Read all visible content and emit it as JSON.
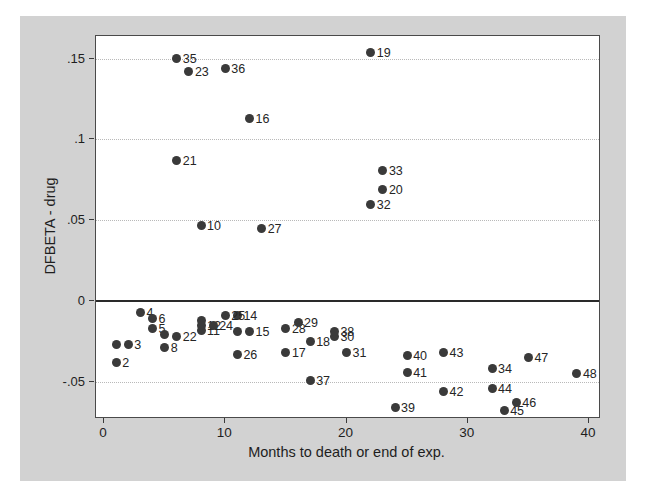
{
  "figure": {
    "page_bg": "#ffffff",
    "panel_bg": "#d2d2d2",
    "plot_bg": "#ffffff",
    "dot_color": "#3a3a3a",
    "grid_color": "#b9b9b9",
    "axis_color": "#2a2a2a"
  },
  "chart_data": {
    "type": "scatter",
    "title": "",
    "xlabel": "Months to death or end of exp.",
    "ylabel": "DFBETA - drug",
    "x_ticks": [
      0,
      10,
      20,
      30,
      40
    ],
    "x_tick_labels": [
      "0",
      "10",
      "20",
      "30",
      "40"
    ],
    "y_ticks": [
      0.15,
      0.1,
      0.05,
      0,
      -0.05
    ],
    "y_tick_labels": [
      ".15",
      ".1",
      ".05",
      "0",
      "-.05"
    ],
    "xlim": [
      -0.66,
      40.95
    ],
    "ylim": [
      -0.0718,
      0.1638
    ],
    "grid": "horizontal-dotted",
    "ref_line_y": 0,
    "legend": "none",
    "marker_labels_position": "right",
    "points": [
      {
        "id": 1,
        "label": "",
        "x": 1,
        "y": -0.027
      },
      {
        "id": 2,
        "label": "2",
        "x": 1,
        "y": -0.038
      },
      {
        "id": 3,
        "label": "3",
        "x": 2,
        "y": -0.027
      },
      {
        "id": 4,
        "label": "4",
        "x": 3,
        "y": -0.007
      },
      {
        "id": 5,
        "label": "5",
        "x": 4,
        "y": -0.017
      },
      {
        "id": 6,
        "label": "6",
        "x": 4,
        "y": -0.011
      },
      {
        "id": 7,
        "label": "",
        "x": 5,
        "y": -0.021
      },
      {
        "id": 8,
        "label": "8",
        "x": 5,
        "y": -0.029
      },
      {
        "id": 9,
        "label": "",
        "x": 8,
        "y": -0.012
      },
      {
        "id": 10,
        "label": "10",
        "x": 8,
        "y": 0.047
      },
      {
        "id": 11,
        "label": "11",
        "x": 8,
        "y": -0.018
      },
      {
        "id": 12,
        "label": "12",
        "x": 8,
        "y": -0.015
      },
      {
        "id": 13,
        "label": "",
        "x": 11,
        "y": -0.019
      },
      {
        "id": 14,
        "label": "14",
        "x": 11,
        "y": -0.009
      },
      {
        "id": 15,
        "label": "15",
        "x": 12,
        "y": -0.019
      },
      {
        "id": 16,
        "label": "16",
        "x": 12,
        "y": 0.113
      },
      {
        "id": 17,
        "label": "17",
        "x": 15,
        "y": -0.032
      },
      {
        "id": 18,
        "label": "18",
        "x": 17,
        "y": -0.025
      },
      {
        "id": 19,
        "label": "19",
        "x": 22,
        "y": 0.154
      },
      {
        "id": 20,
        "label": "20",
        "x": 23,
        "y": 0.069
      },
      {
        "id": 21,
        "label": "21",
        "x": 6,
        "y": 0.087
      },
      {
        "id": 22,
        "label": "22",
        "x": 6,
        "y": -0.022
      },
      {
        "id": 23,
        "label": "23",
        "x": 7,
        "y": 0.142
      },
      {
        "id": 24,
        "label": "24",
        "x": 9,
        "y": -0.015
      },
      {
        "id": 25,
        "label": "25",
        "x": 10,
        "y": -0.009
      },
      {
        "id": 26,
        "label": "26",
        "x": 11,
        "y": -0.033
      },
      {
        "id": 27,
        "label": "27",
        "x": 13,
        "y": 0.045
      },
      {
        "id": 28,
        "label": "28",
        "x": 15,
        "y": -0.017
      },
      {
        "id": 29,
        "label": "29",
        "x": 16,
        "y": -0.013
      },
      {
        "id": 30,
        "label": "30",
        "x": 19,
        "y": -0.022
      },
      {
        "id": 31,
        "label": "31",
        "x": 20,
        "y": -0.032
      },
      {
        "id": 32,
        "label": "32",
        "x": 22,
        "y": 0.06
      },
      {
        "id": 33,
        "label": "33",
        "x": 23,
        "y": 0.081
      },
      {
        "id": 34,
        "label": "34",
        "x": 32,
        "y": -0.042
      },
      {
        "id": 35,
        "label": "35",
        "x": 6,
        "y": 0.15
      },
      {
        "id": 36,
        "label": "36",
        "x": 10,
        "y": 0.144
      },
      {
        "id": 37,
        "label": "37",
        "x": 17,
        "y": -0.049
      },
      {
        "id": 38,
        "label": "38",
        "x": 19,
        "y": -0.019
      },
      {
        "id": 39,
        "label": "39",
        "x": 24,
        "y": -0.066
      },
      {
        "id": 40,
        "label": "40",
        "x": 25,
        "y": -0.034
      },
      {
        "id": 41,
        "label": "41",
        "x": 25,
        "y": -0.044
      },
      {
        "id": 42,
        "label": "42",
        "x": 28,
        "y": -0.056
      },
      {
        "id": 43,
        "label": "43",
        "x": 28,
        "y": -0.032
      },
      {
        "id": 44,
        "label": "44",
        "x": 32,
        "y": -0.054
      },
      {
        "id": 45,
        "label": "45",
        "x": 33,
        "y": -0.068
      },
      {
        "id": 46,
        "label": "46",
        "x": 34,
        "y": -0.063
      },
      {
        "id": 47,
        "label": "47",
        "x": 35,
        "y": -0.035
      },
      {
        "id": 48,
        "label": "48",
        "x": 39,
        "y": -0.045
      }
    ]
  }
}
